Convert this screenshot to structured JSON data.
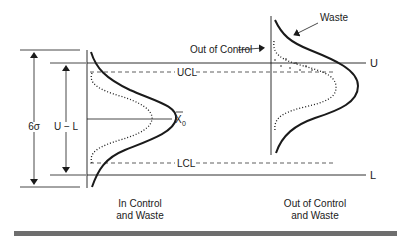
{
  "diagram": {
    "labels": {
      "six_sigma": "6σ",
      "u_minus_l": "U − L",
      "ucl": "UCL",
      "lcl": "LCL",
      "x0_bar": "X",
      "x0_sub": "0",
      "u": "U",
      "l": "L",
      "out_of_control": "Out of Control",
      "waste": "Waste"
    },
    "captions": {
      "left_line1": "In Control",
      "left_line2": "and Waste",
      "right_line1": "Out of Control",
      "right_line2": "and Waste"
    },
    "colors": {
      "ink": "#1a1a1a",
      "rule": "#6e6e6e"
    }
  }
}
